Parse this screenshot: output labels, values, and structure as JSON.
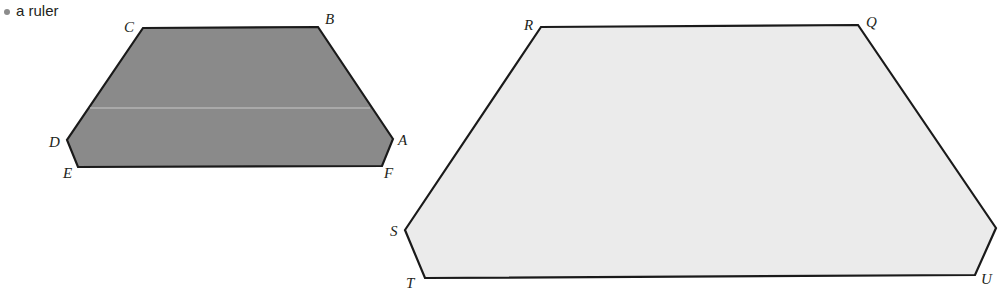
{
  "bullet": {
    "text": "a ruler"
  },
  "colors": {
    "dark_fill": "#8a8a8a",
    "light_fill": "#ebebeb",
    "stroke": "#1a1a1a",
    "text": "#231f20"
  },
  "shapes": [
    {
      "name": "small-hexagon",
      "fill": "dark",
      "vertices": [
        {
          "label": "A",
          "x": 393,
          "y": 139,
          "lx": 398,
          "ly": 145
        },
        {
          "label": "B",
          "x": 318,
          "y": 27,
          "lx": 325,
          "ly": 24
        },
        {
          "label": "C",
          "x": 143,
          "y": 28,
          "lx": 124,
          "ly": 32
        },
        {
          "label": "D",
          "x": 67,
          "y": 140,
          "lx": 49,
          "ly": 147
        },
        {
          "label": "E",
          "x": 78,
          "y": 167,
          "lx": 63,
          "ly": 178
        },
        {
          "label": "F",
          "x": 382,
          "y": 166,
          "lx": 384,
          "ly": 178
        }
      ]
    },
    {
      "name": "large-hexagon",
      "fill": "light",
      "vertices": [
        {
          "label": "Q",
          "x": 858,
          "y": 25,
          "lx": 866,
          "ly": 27
        },
        {
          "label": "R",
          "x": 541,
          "y": 27,
          "lx": 524,
          "ly": 30
        },
        {
          "label": "S",
          "x": 405,
          "y": 230,
          "lx": 390,
          "ly": 236
        },
        {
          "label": "T",
          "x": 425,
          "y": 278,
          "lx": 406,
          "ly": 288
        },
        {
          "label": "U",
          "x": 975,
          "y": 275,
          "lx": 981,
          "ly": 284
        },
        {
          "label": "",
          "x": 996,
          "y": 228,
          "lx": 0,
          "ly": 0
        }
      ]
    }
  ]
}
